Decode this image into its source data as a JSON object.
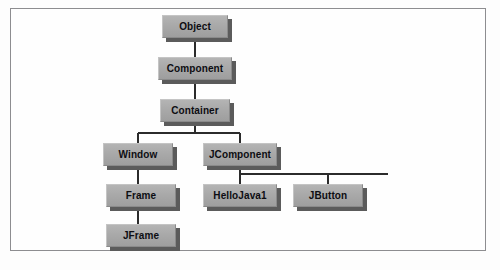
{
  "diagram": {
    "type": "class-hierarchy-tree",
    "colors": {
      "node_fill": "#a9a9a9",
      "node_shadow": "#5b5b5b",
      "edge": "#2b2b2b",
      "border": "#8d8d90",
      "background": "#fefefe",
      "label": "#0d0d12"
    },
    "nodes": [
      {
        "id": "object",
        "label": "Object",
        "x": 162,
        "y": 15,
        "w": 66
      },
      {
        "id": "component",
        "label": "Component",
        "x": 158,
        "y": 57,
        "w": 74
      },
      {
        "id": "container",
        "label": "Container",
        "x": 160,
        "y": 99,
        "w": 70
      },
      {
        "id": "window",
        "label": "Window",
        "x": 103,
        "y": 143,
        "w": 70
      },
      {
        "id": "jcomponent",
        "label": "JComponent",
        "x": 203,
        "y": 143,
        "w": 74
      },
      {
        "id": "frame",
        "label": "Frame",
        "x": 106,
        "y": 184,
        "w": 70
      },
      {
        "id": "hellojava1",
        "label": "HelloJava1",
        "x": 203,
        "y": 184,
        "w": 74
      },
      {
        "id": "jbutton",
        "label": "JButton",
        "x": 293,
        "y": 184,
        "w": 70
      },
      {
        "id": "jframe",
        "label": "JFrame",
        "x": 106,
        "y": 224,
        "w": 70
      }
    ],
    "edges": [
      {
        "from": "object",
        "to": "component",
        "style": "straight"
      },
      {
        "from": "component",
        "to": "container",
        "style": "straight"
      },
      {
        "from": "container",
        "to": "window",
        "style": "elbow"
      },
      {
        "from": "container",
        "to": "jcomponent",
        "style": "elbow"
      },
      {
        "from": "window",
        "to": "frame",
        "style": "straight"
      },
      {
        "from": "frame",
        "to": "jframe",
        "style": "straight"
      },
      {
        "from": "jcomponent",
        "to": "hellojava1",
        "style": "elbow"
      },
      {
        "from": "jcomponent",
        "to": "jbutton",
        "style": "elbow-extended"
      }
    ]
  }
}
